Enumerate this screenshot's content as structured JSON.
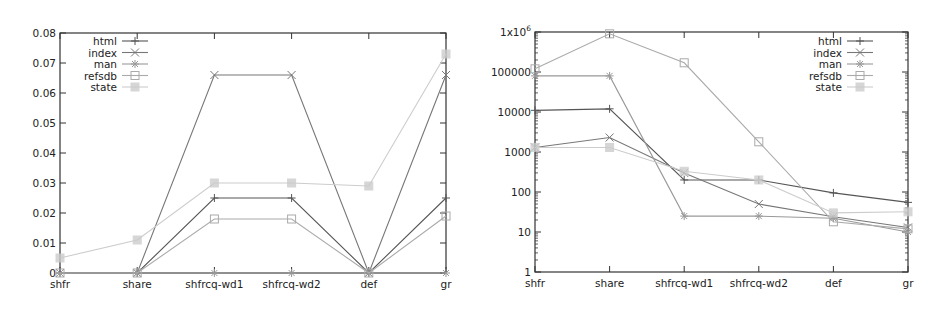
{
  "chart_data": [
    {
      "type": "line",
      "title": "",
      "xlabel": "",
      "ylabel": "",
      "categories": [
        "shfr",
        "share",
        "shfrcq-wd1",
        "shfrcq-wd2",
        "def",
        "gr"
      ],
      "ylim": [
        0,
        0.08
      ],
      "yscale": "linear",
      "yticks": [
        "0",
        "0.01",
        "0.02",
        "0.03",
        "0.04",
        "0.05",
        "0.06",
        "0.07",
        "0.08"
      ],
      "grid": false,
      "legend_position": "top-left",
      "series": [
        {
          "name": "html",
          "marker": "plus",
          "color": "#555555",
          "values": [
            0,
            0,
            0.025,
            0.025,
            0,
            0.025
          ]
        },
        {
          "name": "index",
          "marker": "cross",
          "color": "#777777",
          "values": [
            0,
            0,
            0.066,
            0.066,
            0,
            0.066
          ]
        },
        {
          "name": "man",
          "marker": "star",
          "color": "#999999",
          "values": [
            0,
            0,
            0,
            0,
            0,
            0
          ]
        },
        {
          "name": "refsdb",
          "marker": "square",
          "color": "#aaaaaa",
          "values": [
            0,
            0,
            0.018,
            0.018,
            0,
            0.019
          ]
        },
        {
          "name": "state",
          "marker": "filled-square",
          "color": "#cccccc",
          "values": [
            0.005,
            0.011,
            0.03,
            0.03,
            0.029,
            0.073
          ]
        }
      ]
    },
    {
      "type": "line",
      "title": "",
      "xlabel": "",
      "ylabel": "",
      "categories": [
        "shfr",
        "share",
        "shfrcq-wd1",
        "shfrcq-wd2",
        "def",
        "gr"
      ],
      "ylim": [
        1,
        1000000
      ],
      "yscale": "log",
      "yticks": [
        "1",
        "10",
        "100",
        "1000",
        "10000",
        "100000",
        "1x10^6"
      ],
      "grid": false,
      "legend_position": "top-right",
      "series": [
        {
          "name": "html",
          "marker": "plus",
          "color": "#555555",
          "values": [
            11000,
            12000,
            200,
            200,
            95,
            55
          ]
        },
        {
          "name": "index",
          "marker": "cross",
          "color": "#777777",
          "values": [
            1300,
            2300,
            300,
            50,
            24,
            13
          ]
        },
        {
          "name": "man",
          "marker": "star",
          "color": "#999999",
          "values": [
            80000,
            80000,
            25,
            25,
            22,
            10
          ]
        },
        {
          "name": "refsdb",
          "marker": "square",
          "color": "#aaaaaa",
          "values": [
            120000,
            900000,
            170000,
            1800,
            18,
            12
          ]
        },
        {
          "name": "state",
          "marker": "filled-square",
          "color": "#cccccc",
          "values": [
            1300,
            1300,
            330,
            200,
            30,
            32
          ]
        }
      ]
    }
  ]
}
